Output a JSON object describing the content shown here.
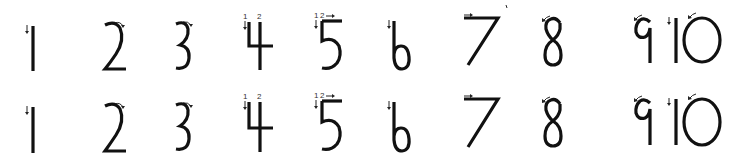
{
  "worksheet": {
    "title": "Number writing stroke order 1-10",
    "ink_color": "#111111",
    "background": "#ffffff",
    "rows": [
      {
        "row": 1,
        "digits": [
          {
            "label": "1",
            "stroke_marks": [
              "down-arrow"
            ]
          },
          {
            "label": "2",
            "stroke_marks": [
              "curved-right-arrow"
            ]
          },
          {
            "label": "3",
            "stroke_marks": [
              "curved-right-arrow"
            ]
          },
          {
            "label": "4",
            "stroke_marks": [
              "1",
              "down-arrow",
              "2"
            ]
          },
          {
            "label": "5",
            "stroke_marks": [
              "1",
              "down-arrow",
              "2",
              "right-arrow"
            ]
          },
          {
            "label": "6",
            "stroke_marks": [
              "down-arrow"
            ]
          },
          {
            "label": "7",
            "stroke_marks": [
              "right-arrow"
            ]
          },
          {
            "label": "8",
            "stroke_marks": [
              "curved-left-arrow"
            ]
          },
          {
            "label": "9",
            "stroke_marks": [
              "curved-left-arrow"
            ]
          },
          {
            "label": "10",
            "stroke_marks": [
              "down-arrow",
              "curved-left-arrow"
            ]
          }
        ]
      },
      {
        "row": 2,
        "digits": [
          {
            "label": "1",
            "stroke_marks": [
              "down-arrow"
            ]
          },
          {
            "label": "2",
            "stroke_marks": [
              "curved-right-arrow"
            ]
          },
          {
            "label": "3",
            "stroke_marks": [
              "curved-right-arrow"
            ]
          },
          {
            "label": "4",
            "stroke_marks": [
              "1",
              "down-arrow",
              "2"
            ]
          },
          {
            "label": "5",
            "stroke_marks": [
              "1",
              "down-arrow",
              "2",
              "right-arrow"
            ]
          },
          {
            "label": "6",
            "stroke_marks": [
              "down-arrow"
            ]
          },
          {
            "label": "7",
            "stroke_marks": [
              "right-arrow"
            ]
          },
          {
            "label": "8",
            "stroke_marks": [
              "curved-left-arrow"
            ]
          },
          {
            "label": "9",
            "stroke_marks": [
              "curved-left-arrow"
            ]
          },
          {
            "label": "10",
            "stroke_marks": [
              "down-arrow",
              "curved-left-arrow"
            ]
          }
        ]
      }
    ],
    "stroke_order_numbers": {
      "first": "1",
      "second": "2"
    }
  }
}
